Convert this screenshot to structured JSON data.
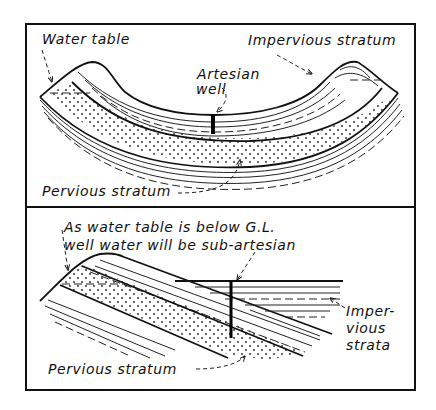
{
  "figure": {
    "panel_top": {
      "title": "Artesian well in a synclinal basin",
      "labels": {
        "water_table": "Water table",
        "impervious_stratum": "Impervious stratum",
        "artesian_line1": "Artesian",
        "artesian_line2": "well",
        "pervious_stratum": "Pervious stratum"
      }
    },
    "panel_bottom": {
      "title": "Sub-artesian well in a monoclinal slope",
      "labels": {
        "note_line1": "As water table is below G.L.",
        "note_line2": "well water will be sub-artesian",
        "impervious_line1": "Imper-",
        "impervious_line2": "vious",
        "impervious_line3": "strata",
        "pervious_stratum": "Pervious stratum"
      }
    }
  }
}
